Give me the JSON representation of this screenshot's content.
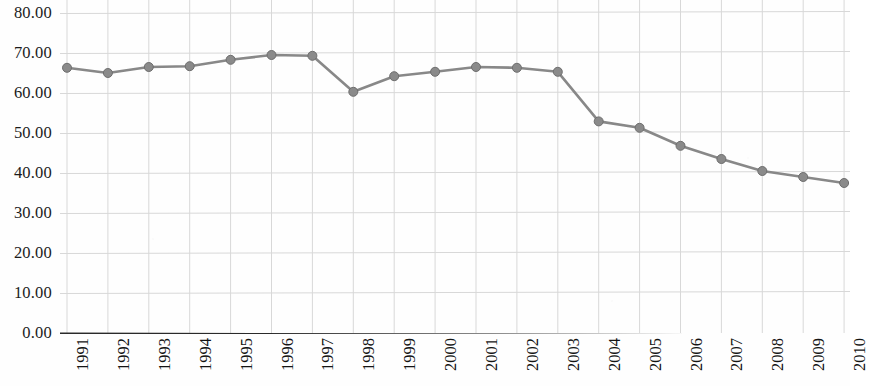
{
  "chart_data": {
    "type": "line",
    "title": "",
    "subtitle": "",
    "xlabel": "",
    "ylabel": "",
    "categories": [
      "1991",
      "1992",
      "1993",
      "1994",
      "1995",
      "1996",
      "1997",
      "1998",
      "1999",
      "2000",
      "2001",
      "2002",
      "2003",
      "2004",
      "2005",
      "2006",
      "2007",
      "2008",
      "2009",
      "2010"
    ],
    "values": [
      66.3,
      65.0,
      66.5,
      66.7,
      68.3,
      69.5,
      69.3,
      60.3,
      64.2,
      65.3,
      66.5,
      66.3,
      65.3,
      52.9,
      51.3,
      46.8,
      43.5,
      40.5,
      39.0,
      37.5
    ],
    "series": [
      {
        "name": "series-1",
        "values": [
          66.3,
          65.0,
          66.5,
          66.7,
          68.3,
          69.5,
          69.3,
          60.3,
          64.2,
          65.3,
          66.5,
          66.3,
          65.3,
          52.9,
          51.3,
          46.8,
          43.5,
          40.5,
          39.0,
          37.5
        ]
      }
    ],
    "ylim": [
      0,
      80
    ],
    "ytick_step": 10,
    "ytick_labels": [
      "0.00",
      "10.00",
      "20.00",
      "30.00",
      "40.00",
      "50.00",
      "60.00",
      "70.00",
      "80.00"
    ],
    "ytick_values": [
      0,
      10,
      20,
      30,
      40,
      50,
      60,
      70,
      80
    ],
    "grid": {
      "horizontal": true,
      "vertical": true
    },
    "legend": {
      "visible": false,
      "position": "none"
    },
    "marker": {
      "shape": "circle",
      "color": "#8a8a8a",
      "edge_color": "#6e6e6e",
      "size": 9
    },
    "line": {
      "color": "#888888",
      "width": 2.6
    },
    "colors": {
      "line": "#888888",
      "marker": "#8a8a8a",
      "grid": "#d8d8d8",
      "axis": "#2a2a2a",
      "text": "#161616",
      "background": "#fefefe"
    }
  },
  "axes": {
    "x_axis_name": "year-axis",
    "y_axis_name": "value-axis"
  }
}
